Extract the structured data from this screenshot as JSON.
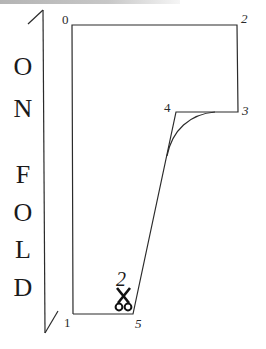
{
  "diagram": {
    "type": "sewing-pattern-piece",
    "fold_label": {
      "letters": [
        "O",
        "N",
        "F",
        "O",
        "L",
        "D"
      ],
      "text": "ON FOLD"
    },
    "points": [
      {
        "id": "0",
        "label": "0",
        "x": 72,
        "y": 25
      },
      {
        "id": "1",
        "label": "1",
        "x": 73,
        "y": 314
      },
      {
        "id": "2",
        "label": "2",
        "x": 237,
        "y": 25
      },
      {
        "id": "3",
        "label": "3",
        "x": 238,
        "y": 112
      },
      {
        "id": "4",
        "label": "4",
        "x": 176,
        "y": 112
      },
      {
        "id": "5",
        "label": "5",
        "x": 133,
        "y": 314
      }
    ],
    "cut_instruction": {
      "count": "2",
      "icon": "scissors-icon"
    },
    "colors": {
      "line": "#2b2b2b",
      "text": "#1a1a1a",
      "background": "#ffffff"
    }
  }
}
